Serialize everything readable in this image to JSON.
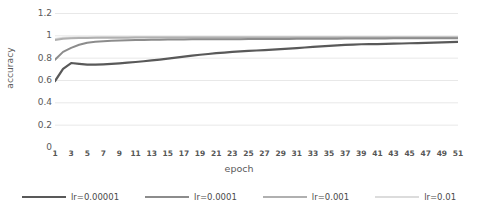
{
  "chart_data": {
    "type": "line",
    "title": "",
    "xlabel": "epoch",
    "ylabel": "accuracy",
    "xlim": [
      1,
      51
    ],
    "ylim": [
      0,
      1.2
    ],
    "grid": true,
    "legend_position": "bottom",
    "y_ticks": [
      "0",
      "0.2",
      "0.4",
      "0.6",
      "0.8",
      "1",
      "1.2"
    ],
    "y_tick_values": [
      0,
      0.2,
      0.4,
      0.6,
      0.8,
      1,
      1.2
    ],
    "x_ticks": [
      "1",
      "3",
      "5",
      "7",
      "9",
      "11",
      "13",
      "15",
      "17",
      "19",
      "21",
      "23",
      "25",
      "27",
      "29",
      "31",
      "33",
      "35",
      "37",
      "39",
      "41",
      "43",
      "45",
      "47",
      "49",
      "51"
    ],
    "x_tick_values": [
      1,
      3,
      5,
      7,
      9,
      11,
      13,
      15,
      17,
      19,
      21,
      23,
      25,
      27,
      29,
      31,
      33,
      35,
      37,
      39,
      41,
      43,
      45,
      47,
      49,
      51
    ],
    "x": [
      1,
      2,
      3,
      4,
      5,
      6,
      7,
      8,
      9,
      10,
      11,
      12,
      13,
      14,
      15,
      16,
      17,
      18,
      19,
      20,
      21,
      22,
      23,
      24,
      25,
      26,
      27,
      28,
      29,
      30,
      31,
      32,
      33,
      34,
      35,
      36,
      37,
      38,
      39,
      40,
      41,
      42,
      43,
      44,
      45,
      46,
      47,
      48,
      49,
      50,
      51
    ],
    "series": [
      {
        "name": "lr=0.00001",
        "color": "#595959",
        "width": 2.2,
        "values": [
          0.59,
          0.7,
          0.752,
          0.745,
          0.738,
          0.737,
          0.74,
          0.744,
          0.749,
          0.755,
          0.761,
          0.768,
          0.775,
          0.783,
          0.791,
          0.8,
          0.809,
          0.818,
          0.826,
          0.833,
          0.84,
          0.846,
          0.851,
          0.856,
          0.86,
          0.864,
          0.868,
          0.872,
          0.876,
          0.881,
          0.886,
          0.891,
          0.896,
          0.901,
          0.906,
          0.91,
          0.914,
          0.917,
          0.92,
          0.921,
          0.922,
          0.923,
          0.925,
          0.927,
          0.929,
          0.931,
          0.933,
          0.935,
          0.937,
          0.939,
          0.941
        ]
      },
      {
        "name": "lr=0.0001",
        "color": "#8c8c8c",
        "width": 2.0,
        "values": [
          0.782,
          0.852,
          0.888,
          0.916,
          0.934,
          0.942,
          0.947,
          0.951,
          0.954,
          0.956,
          0.958,
          0.959,
          0.96,
          0.961,
          0.962,
          0.963,
          0.963,
          0.964,
          0.964,
          0.965,
          0.965,
          0.966,
          0.966,
          0.966,
          0.967,
          0.967,
          0.967,
          0.968,
          0.968,
          0.968,
          0.969,
          0.969,
          0.969,
          0.97,
          0.97,
          0.97,
          0.971,
          0.971,
          0.971,
          0.972,
          0.972,
          0.972,
          0.973,
          0.973,
          0.973,
          0.974,
          0.974,
          0.974,
          0.975,
          0.975,
          0.975
        ]
      },
      {
        "name": "lr=0.001",
        "color": "#b0b0b0",
        "width": 2.0,
        "values": [
          0.958,
          0.97,
          0.974,
          0.976,
          0.977,
          0.978,
          0.978,
          0.979,
          0.979,
          0.979,
          0.98,
          0.98,
          0.98,
          0.98,
          0.98,
          0.981,
          0.981,
          0.981,
          0.981,
          0.981,
          0.981,
          0.981,
          0.981,
          0.981,
          0.981,
          0.981,
          0.981,
          0.981,
          0.981,
          0.981,
          0.981,
          0.981,
          0.981,
          0.981,
          0.981,
          0.981,
          0.981,
          0.981,
          0.981,
          0.981,
          0.981,
          0.981,
          0.981,
          0.981,
          0.981,
          0.981,
          0.981,
          0.981,
          0.981,
          0.981,
          0.981
        ]
      },
      {
        "name": "lr=0.01",
        "color": "#dcdcdc",
        "width": 2.0,
        "values": [
          0.968,
          0.978,
          0.981,
          0.982,
          0.983,
          0.983,
          0.984,
          0.984,
          0.984,
          0.984,
          0.985,
          0.985,
          0.985,
          0.985,
          0.985,
          0.985,
          0.985,
          0.985,
          0.985,
          0.985,
          0.985,
          0.985,
          0.985,
          0.985,
          0.985,
          0.985,
          0.985,
          0.985,
          0.985,
          0.985,
          0.985,
          0.985,
          0.985,
          0.985,
          0.985,
          0.985,
          0.985,
          0.985,
          0.985,
          0.985,
          0.985,
          0.985,
          0.985,
          0.985,
          0.985,
          0.985,
          0.985,
          0.985,
          0.985,
          0.985,
          0.985
        ]
      }
    ]
  },
  "legend": {
    "items": [
      {
        "label": "lr=0.00001"
      },
      {
        "label": "lr=0.0001"
      },
      {
        "label": "lr=0.001"
      },
      {
        "label": "lr=0.01"
      }
    ]
  },
  "colors": {
    "gridline": "#e8e8e8",
    "text": "#5a5a5a",
    "background": "#ffffff"
  }
}
